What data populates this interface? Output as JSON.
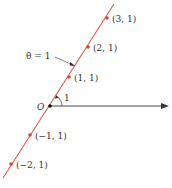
{
  "diagram": {
    "title_label": "θ = 1",
    "origin_label": "O",
    "angle_label": "1",
    "line_color": "#e05a4a",
    "point_color": "#d9443a",
    "axis_color": "#333333",
    "points": [
      {
        "label": "(3, 1)",
        "r": 3,
        "theta": 1
      },
      {
        "label": "(2, 1)",
        "r": 2,
        "theta": 1
      },
      {
        "label": "(1, 1)",
        "r": 1,
        "theta": 1
      },
      {
        "label": "(−1, 1)",
        "r": -1,
        "theta": 1
      },
      {
        "label": "(−2, 1)",
        "r": -2,
        "theta": 1
      }
    ]
  }
}
